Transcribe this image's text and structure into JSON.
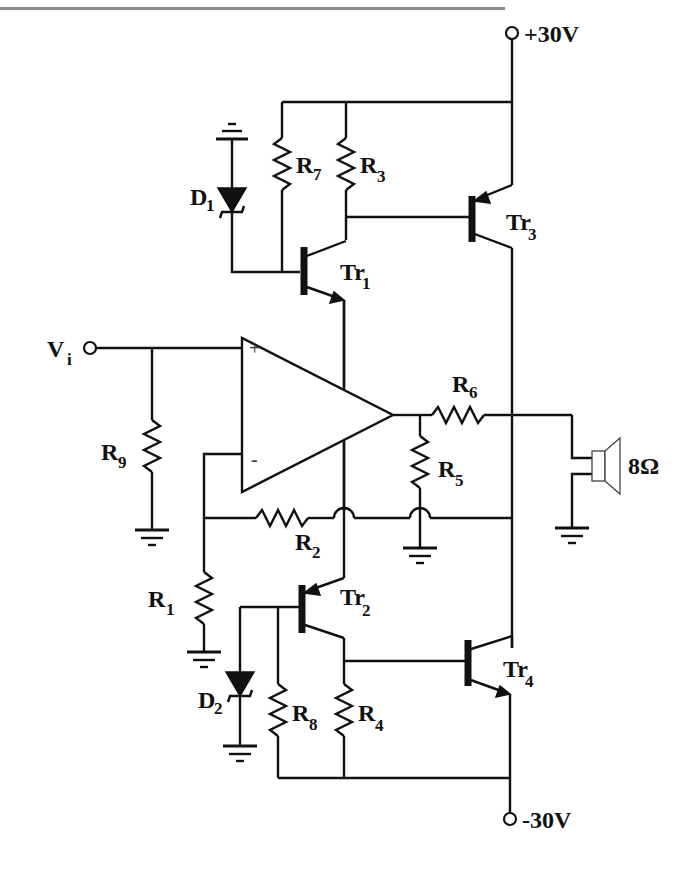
{
  "diagram": {
    "type": "circuit-schematic",
    "supplies": {
      "positive": {
        "label": "+30V"
      },
      "negative": {
        "label": "-30V"
      }
    },
    "input": {
      "label": "V",
      "subscript": "i"
    },
    "load": {
      "label": "8Ω",
      "type": "speaker"
    },
    "opamp": {
      "plus": "+",
      "minus": "-"
    },
    "resistors": [
      {
        "id": "R1",
        "label": "R",
        "subscript": "1"
      },
      {
        "id": "R2",
        "label": "R",
        "subscript": "2"
      },
      {
        "id": "R3",
        "label": "R",
        "subscript": "3"
      },
      {
        "id": "R4",
        "label": "R",
        "subscript": "4"
      },
      {
        "id": "R5",
        "label": "R",
        "subscript": "5"
      },
      {
        "id": "R6",
        "label": "R",
        "subscript": "6"
      },
      {
        "id": "R7",
        "label": "R",
        "subscript": "7"
      },
      {
        "id": "R8",
        "label": "R",
        "subscript": "8"
      },
      {
        "id": "R9",
        "label": "R",
        "subscript": "9"
      }
    ],
    "diodes": [
      {
        "id": "D1",
        "label": "D",
        "subscript": "1",
        "type": "zener"
      },
      {
        "id": "D2",
        "label": "D",
        "subscript": "2",
        "type": "zener"
      }
    ],
    "transistors": [
      {
        "id": "Tr1",
        "label": "Tr",
        "subscript": "1",
        "type": "NPN"
      },
      {
        "id": "Tr2",
        "label": "Tr",
        "subscript": "2",
        "type": "PNP"
      },
      {
        "id": "Tr3",
        "label": "Tr",
        "subscript": "3",
        "type": "PNP"
      },
      {
        "id": "Tr4",
        "label": "Tr",
        "subscript": "4",
        "type": "NPN"
      }
    ]
  }
}
